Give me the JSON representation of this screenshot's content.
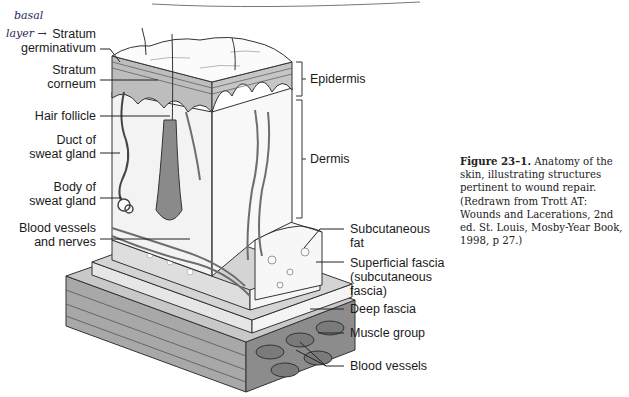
{
  "annotation": {
    "handwritten_line1": "basal",
    "handwritten_line2": "layer",
    "arrow": "→"
  },
  "labels_left": [
    {
      "id": "stratum-germinativum",
      "line1": "Stratum",
      "line2": "germinativum"
    },
    {
      "id": "stratum-corneum",
      "line1": "Stratum",
      "line2": "corneum"
    },
    {
      "id": "hair-follicle",
      "line1": "Hair follicle",
      "line2": ""
    },
    {
      "id": "duct-of-sweat-gland",
      "line1": "Duct of",
      "line2": "sweat gland"
    },
    {
      "id": "body-of-sweat-gland",
      "line1": "Body of",
      "line2": "sweat gland"
    },
    {
      "id": "blood-vessels-and-nerves",
      "line1": "Blood vessels",
      "line2": "and nerves"
    }
  ],
  "labels_right": [
    {
      "id": "epidermis",
      "line1": "Epidermis"
    },
    {
      "id": "dermis",
      "line1": "Dermis"
    },
    {
      "id": "subcutaneous-fat",
      "line1": "Subcutaneous",
      "line2": "fat"
    },
    {
      "id": "superficial-fascia",
      "line1": "Superficial fascia",
      "line2": "(subcutaneous",
      "line3": "fascia)"
    },
    {
      "id": "deep-fascia",
      "line1": "Deep fascia"
    },
    {
      "id": "muscle-group",
      "line1": "Muscle group"
    },
    {
      "id": "blood-vessels",
      "line1": "Blood vessels"
    }
  ],
  "caption": {
    "figure_number": "Figure 23–1.",
    "text": "Anatomy of the skin, illustrating structures pertinent to wound repair. (Redrawn from Trott AT: Wounds and Lacerations, 2nd ed. St. Louis, Mosby-Year Book, 1998, p 27.)"
  },
  "colors": {
    "ink": "#1a1a1a",
    "epidermis": "#bdbdbd",
    "dermis": "#f2f2f2",
    "fat": "#ececec",
    "fascia": "#d9d9d9",
    "muscle": "#9a9a9a",
    "vessel": "#6e6e6e"
  }
}
